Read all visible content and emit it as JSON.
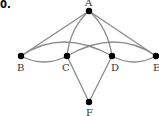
{
  "problem_number": "0.",
  "colors": {
    "edge": "#8a8a8a",
    "node": "#000000",
    "label": "#333333"
  },
  "graph": {
    "nodes": [
      {
        "id": "A",
        "label": "A",
        "x": 89,
        "y": 11
      },
      {
        "id": "B",
        "label": "B",
        "x": 21,
        "y": 56
      },
      {
        "id": "C",
        "label": "C",
        "x": 67,
        "y": 56
      },
      {
        "id": "D",
        "label": "D",
        "x": 112,
        "y": 56
      },
      {
        "id": "E",
        "label": "E",
        "x": 156,
        "y": 56
      },
      {
        "id": "F",
        "label": "F",
        "x": 89,
        "y": 102
      }
    ],
    "edges": [
      {
        "from": "A",
        "to": "B",
        "shape": "straight"
      },
      {
        "from": "A",
        "to": "E",
        "shape": "straight"
      },
      {
        "from": "A",
        "to": "C",
        "shape": "curve"
      },
      {
        "from": "A",
        "to": "D",
        "shape": "curve"
      },
      {
        "from": "B",
        "to": "C",
        "shape": "curve"
      },
      {
        "from": "B",
        "to": "D",
        "shape": "arc"
      },
      {
        "from": "C",
        "to": "E",
        "shape": "arc"
      },
      {
        "from": "D",
        "to": "E",
        "shape": "curve"
      },
      {
        "from": "C",
        "to": "F",
        "shape": "straight"
      },
      {
        "from": "D",
        "to": "F",
        "shape": "straight"
      }
    ]
  }
}
